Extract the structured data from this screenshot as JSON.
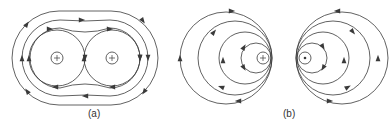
{
  "figure": {
    "stroke_color": "#3a3a3a",
    "background": "#ffffff"
  },
  "panels": [
    {
      "id": "a",
      "caption": "(a)",
      "caption_pos": [
        88,
        108
      ],
      "description": "Two parallel conductors carrying current in the same direction (both into page)",
      "conductors": [
        {
          "cx": 57,
          "cy": 58,
          "r": 6,
          "symbol": "plus"
        },
        {
          "cx": 112,
          "cy": 58,
          "r": 6,
          "symbol": "plus"
        }
      ],
      "local_loops": [
        {
          "cx": 57,
          "cy": 58,
          "r": 28,
          "arrows": [
            {
              "angle": 180,
              "dir": "up"
            },
            {
              "angle": 0,
              "dir": "down"
            }
          ]
        },
        {
          "cx": 112,
          "cy": 58,
          "r": 28,
          "arrows": [
            {
              "angle": 180,
              "dir": "up"
            },
            {
              "angle": 0,
              "dir": "down"
            }
          ]
        }
      ],
      "enclosing_loops": [
        {
          "x1": 30,
          "x2": 140,
          "cy": 58,
          "ry": 30,
          "pinch": 4,
          "arrows": "inner"
        },
        {
          "x1": 22,
          "x2": 148,
          "cy": 58,
          "ry": 38,
          "pinch": 1,
          "arrows": "mid"
        },
        {
          "x1": 12,
          "x2": 158,
          "cy": 58,
          "ry": 47,
          "pinch": 0,
          "arrows": "outer"
        }
      ]
    },
    {
      "id": "b",
      "caption": "(b)",
      "caption_pos": [
        283,
        108
      ],
      "description": "Two parallel conductors carrying current in opposite directions (into and out of page)",
      "conductors": [
        {
          "cx": 263,
          "cy": 58,
          "r": 6,
          "symbol": "plus"
        },
        {
          "cx": 305,
          "cy": 58,
          "r": 6,
          "symbol": "dot"
        }
      ],
      "left_loops": [
        {
          "cx": 256,
          "cy": 58,
          "r": 15
        },
        {
          "cx": 245,
          "cy": 58,
          "r": 26
        },
        {
          "cx": 235,
          "cy": 58,
          "r": 37
        },
        {
          "cx": 226,
          "cy": 58,
          "r": 46
        }
      ],
      "right_loops": [
        {
          "cx": 312,
          "cy": 58,
          "r": 15
        },
        {
          "cx": 323,
          "cy": 58,
          "r": 26
        },
        {
          "cx": 333,
          "cy": 58,
          "r": 37
        },
        {
          "cx": 342,
          "cy": 58,
          "r": 46
        }
      ]
    }
  ],
  "labels": {
    "a": "(a)",
    "b": "(b)"
  }
}
